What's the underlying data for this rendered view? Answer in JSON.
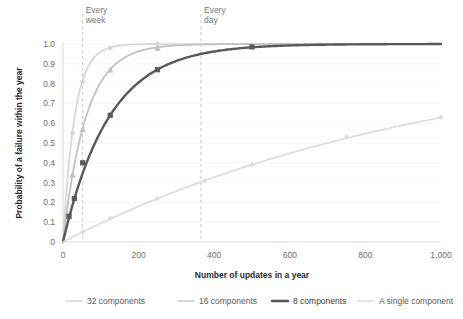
{
  "chart_data": {
    "type": "line",
    "title": "",
    "xlabel": "Number of updates in a year",
    "ylabel": "Probability of a failure within the year",
    "xlim": [
      0,
      1000
    ],
    "ylim": [
      0,
      1.0
    ],
    "grid": "horizontal-light",
    "legend_position": "bottom",
    "x_ticks": [
      0,
      200,
      400,
      600,
      800,
      1000
    ],
    "x_tick_labels": [
      "0",
      "200",
      "400",
      "600",
      "800",
      "1,000"
    ],
    "y_ticks": [
      0,
      0.1,
      0.2,
      0.3,
      0.4,
      0.5,
      0.6,
      0.7,
      0.8,
      0.9,
      1.0
    ],
    "y_tick_labels": [
      "0",
      "0.1",
      "0.2",
      "0.3",
      "0.4",
      "0.5",
      "0.6",
      "0.7",
      "0.8",
      "0.9",
      "1.0"
    ],
    "annotations": [
      {
        "label": "Every\nweek",
        "line1": "Every",
        "line2": "week",
        "x": 52
      },
      {
        "label": "Every\nday",
        "line1": "Every",
        "line2": "day",
        "x": 365
      }
    ],
    "series": [
      {
        "name": "32 components",
        "color": "#d6d6d6",
        "width": 1.7,
        "marker": "diamond",
        "failure_rate_per_update": 0.032,
        "x": [
          0,
          12,
          25,
          37,
          52,
          75,
          125,
          250,
          500,
          1000
        ],
        "values": [
          0,
          0.32,
          0.55,
          0.7,
          0.81,
          0.91,
          0.98,
          1.0,
          1.0,
          1.0
        ],
        "marker_x": [
          25,
          52,
          125,
          250
        ],
        "marker_y": [
          0.55,
          0.81,
          0.98,
          1.0
        ]
      },
      {
        "name": "16 components",
        "color": "#c2c2c2",
        "width": 1.8,
        "marker": "triangle",
        "failure_rate_per_update": 0.0163,
        "x": [
          0,
          12,
          25,
          52,
          75,
          125,
          250,
          500,
          1000
        ],
        "values": [
          0,
          0.18,
          0.34,
          0.57,
          0.71,
          0.87,
          0.98,
          1.0,
          1.0
        ],
        "marker_x": [
          25,
          52,
          125,
          250
        ],
        "marker_y": [
          0.34,
          0.57,
          0.87,
          0.98
        ]
      },
      {
        "name": "8 components",
        "color": "#595959",
        "width": 2.4,
        "marker": "square",
        "failure_rate_per_update": 0.00816,
        "x": [
          0,
          12,
          25,
          52,
          75,
          125,
          250,
          500,
          1000
        ],
        "values": [
          0,
          0.09,
          0.18,
          0.35,
          0.46,
          0.64,
          0.87,
          0.98,
          1.0
        ],
        "marker_x": [
          16,
          30,
          52,
          125,
          250,
          500
        ],
        "marker_y": [
          0.13,
          0.22,
          0.4,
          0.64,
          0.87,
          0.985
        ]
      },
      {
        "name": "A single component",
        "color": "#dcdcdc",
        "width": 1.7,
        "marker": "diamond",
        "failure_rate_per_update": 0.00099,
        "x": [
          0,
          52,
          125,
          250,
          375,
          500,
          625,
          750,
          875,
          1000
        ],
        "values": [
          0,
          0.05,
          0.12,
          0.22,
          0.31,
          0.39,
          0.46,
          0.53,
          0.58,
          0.63
        ],
        "marker_x": [
          52,
          125,
          250,
          375,
          500,
          750,
          1000
        ],
        "marker_y": [
          0.05,
          0.12,
          0.22,
          0.31,
          0.39,
          0.53,
          0.63
        ]
      }
    ]
  },
  "legend": {
    "items": [
      {
        "label": "32 components",
        "color": "#d6d6d6",
        "bold": false
      },
      {
        "label": "16 components",
        "color": "#c9c9c9",
        "bold": false
      },
      {
        "label": "8 components",
        "color": "#595959",
        "bold": true
      },
      {
        "label": "A single component",
        "color": "#dcdcdc",
        "bold": false
      }
    ]
  },
  "axis": {
    "x_title": "Number of updates in a year",
    "y_title": "Probability of a failure within the year"
  }
}
